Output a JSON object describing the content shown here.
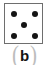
{
  "figure": {
    "kind": "die-face-illustration",
    "caption": {
      "open_paren": "(",
      "letter": "b",
      "close_paren": ")",
      "full_text": "(b)",
      "letter_color": "#141414",
      "paren_color": "#bdbdbd"
    },
    "die": {
      "value": 5,
      "pattern": "quincunx",
      "pip_count": 5,
      "pip_color": "#141414",
      "face_fill": "#ffffff",
      "border_color": "#6e6e6e",
      "pips": [
        {
          "name": "top-left",
          "x": 13,
          "y": 13
        },
        {
          "name": "top-right",
          "x": 34,
          "y": 13
        },
        {
          "name": "center",
          "x": 24,
          "y": 24
        },
        {
          "name": "bottom-left",
          "x": 13,
          "y": 35
        },
        {
          "name": "bottom-right",
          "x": 34,
          "y": 35
        }
      ]
    },
    "background": "#ffffff"
  }
}
